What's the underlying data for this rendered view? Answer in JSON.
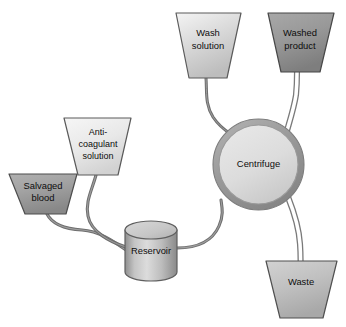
{
  "diagram": {
    "background_color": "#ffffff",
    "tube_color": "#6e6e6e",
    "tube_outline_color": "#7a7a7a",
    "label_color": "#0d0d0d",
    "nodes": [
      {
        "id": "salvaged-blood",
        "label_lines": [
          "Salvaged",
          "blood"
        ],
        "shape": "trapezoid",
        "fill_top": "#a6a6a6",
        "fill_bottom": "#8e8e8e",
        "stroke": "#4d4d4d"
      },
      {
        "id": "anticoagulant-solution",
        "label_lines": [
          "Anti-",
          "coagulant",
          "solution"
        ],
        "shape": "trapezoid",
        "fill_top": "#f2f2f2",
        "fill_bottom": "#d8d8d8",
        "stroke": "#5a5a5a"
      },
      {
        "id": "wash-solution",
        "label_lines": [
          "Wash",
          "solution"
        ],
        "shape": "trapezoid",
        "fill_top": "#f0f0f0",
        "fill_bottom": "#c2c2c2",
        "stroke": "#5a5a5a"
      },
      {
        "id": "washed-product",
        "label_lines": [
          "Washed",
          "product"
        ],
        "shape": "trapezoid",
        "fill_top": "#a0a0a0",
        "fill_bottom": "#848484",
        "stroke": "#474747"
      },
      {
        "id": "centrifuge",
        "label_lines": [
          "Centrifuge"
        ],
        "shape": "circle",
        "fill_top": "#e2e2e2",
        "fill_bottom": "#cfcfcf",
        "stroke": "#8c8c8c"
      },
      {
        "id": "reservoir",
        "label_lines": [
          "Reservoir"
        ],
        "shape": "cylinder",
        "fill_top": "#d6d6d6",
        "fill_bottom": "#9c9c9c",
        "stroke": "#5f5f5f"
      },
      {
        "id": "waste",
        "label_lines": [
          "Waste"
        ],
        "shape": "trapezoid",
        "fill_top": "#c9c9c9",
        "fill_bottom": "#adadad",
        "stroke": "#4f4f4f"
      }
    ],
    "connections": [
      {
        "id": "salvaged-blood-to-reservoir",
        "from": "salvaged-blood",
        "to": "reservoir",
        "style": "solid"
      },
      {
        "id": "anticoagulant-to-reservoir",
        "from": "anticoagulant-solution",
        "to": "reservoir",
        "style": "solid"
      },
      {
        "id": "reservoir-to-centrifuge",
        "from": "reservoir",
        "to": "centrifuge",
        "style": "solid"
      },
      {
        "id": "wash-solution-to-centrifuge",
        "from": "wash-solution",
        "to": "centrifuge",
        "style": "solid"
      },
      {
        "id": "centrifuge-to-washed-product",
        "from": "centrifuge",
        "to": "washed-product",
        "style": "double"
      },
      {
        "id": "centrifuge-to-waste",
        "from": "centrifuge",
        "to": "waste",
        "style": "double"
      }
    ]
  }
}
